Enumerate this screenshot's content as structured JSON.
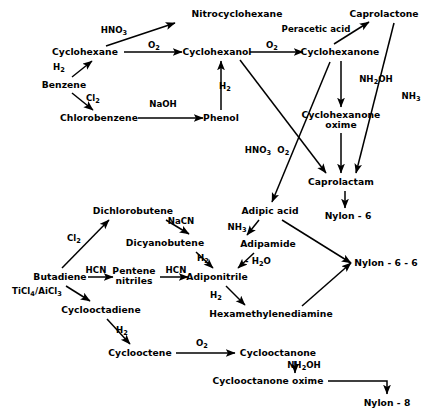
{
  "diagram": {
    "type": "reaction-scheme",
    "stroke_color": "#000000",
    "background_color": "#ffffff",
    "nodes": [
      {
        "id": "nitrocyclohexane",
        "label": "Nitrocyclohexane",
        "x": 237,
        "y": 14
      },
      {
        "id": "caprolactone",
        "label": "Caprolactone",
        "x": 384,
        "y": 14
      },
      {
        "id": "peracetic-acid",
        "label": "Peracetic acid",
        "x": 316,
        "y": 30
      },
      {
        "id": "cyclohexane",
        "label": "Cyclohexane",
        "x": 85,
        "y": 52
      },
      {
        "id": "cyclohexanol",
        "label": "Cyclohexanol",
        "x": 217,
        "y": 52
      },
      {
        "id": "cyclohexanone",
        "label": "Cyclohexanone",
        "x": 340,
        "y": 52
      },
      {
        "id": "benzene",
        "label": "Benzene",
        "x": 64,
        "y": 85
      },
      {
        "id": "chlorobenzene",
        "label": "Chlorobenzene",
        "x": 99,
        "y": 118
      },
      {
        "id": "phenol",
        "label": "Phenol",
        "x": 221,
        "y": 118
      },
      {
        "id": "cyclohexanone-oxime",
        "label": "Cyclohexanone\noxime",
        "x": 341,
        "y": 120
      },
      {
        "id": "caprolactam",
        "label": "Caprolactam",
        "x": 341,
        "y": 182
      },
      {
        "id": "adipic-acid",
        "label": "Adipic acid",
        "x": 270,
        "y": 211
      },
      {
        "id": "nylon-6",
        "label": "Nylon - 6",
        "x": 348,
        "y": 216
      },
      {
        "id": "dichlorobutene",
        "label": "Dichlorobutene",
        "x": 133,
        "y": 211
      },
      {
        "id": "dicyanobutene",
        "label": "Dicyanobutene",
        "x": 165,
        "y": 243
      },
      {
        "id": "adipamide",
        "label": "Adipamide",
        "x": 268,
        "y": 244
      },
      {
        "id": "butadiene",
        "label": "Butadiene",
        "x": 60,
        "y": 277
      },
      {
        "id": "pentene-nitriles",
        "label": "Pentene\nnitriles",
        "x": 134,
        "y": 276
      },
      {
        "id": "adiponitrile",
        "label": "Adiponitrile",
        "x": 217,
        "y": 277
      },
      {
        "id": "nylon-6-6",
        "label": "Nylon - 6 - 6",
        "x": 386,
        "y": 263
      },
      {
        "id": "cyclooctadiene",
        "label": "Cyclooctadiene",
        "x": 101,
        "y": 310
      },
      {
        "id": "hexamethylenediamine",
        "label": "Hexamethylenediamine",
        "x": 271,
        "y": 314
      },
      {
        "id": "cyclooctene",
        "label": "Cyclooctene",
        "x": 140,
        "y": 353
      },
      {
        "id": "cyclooctanone",
        "label": "Cyclooctanone",
        "x": 278,
        "y": 353
      },
      {
        "id": "cyclooctanone-oxime",
        "label": "Cyclooctanone oxime",
        "x": 268,
        "y": 381
      },
      {
        "id": "nylon-8",
        "label": "Nylon - 8",
        "x": 387,
        "y": 403
      }
    ],
    "reagents": [
      {
        "id": "hno3-a",
        "label": "HNO<sub>3</sub>",
        "x": 114,
        "y": 31
      },
      {
        "id": "o2-a",
        "label": "O<sub>2</sub>",
        "x": 154,
        "y": 46
      },
      {
        "id": "o2-b",
        "label": "O<sub>2</sub>",
        "x": 272,
        "y": 46
      },
      {
        "id": "h2-benzene",
        "label": "H<sub>2</sub>",
        "x": 59,
        "y": 68
      },
      {
        "id": "nh2oh-a",
        "label": "NH<sub>2</sub>OH",
        "x": 376,
        "y": 80
      },
      {
        "id": "nh3-caprolactone",
        "label": "NH<sub>3</sub>",
        "x": 411,
        "y": 97
      },
      {
        "id": "cl2-benzene",
        "label": "Cl<sub>2</sub>",
        "x": 93,
        "y": 99
      },
      {
        "id": "naoh",
        "label": "NaOH",
        "x": 163,
        "y": 105
      },
      {
        "id": "h2-phenol",
        "label": "H<sub>2</sub>",
        "x": 225,
        "y": 87
      },
      {
        "id": "hno3-o2",
        "label": "HNO<sub>3</sub>  O<sub>2</sub>",
        "x": 267,
        "y": 151
      },
      {
        "id": "cl2-butadiene",
        "label": "Cl<sub>2</sub>",
        "x": 74,
        "y": 239
      },
      {
        "id": "nacn",
        "label": "NaCN",
        "x": 181,
        "y": 222
      },
      {
        "id": "nh3-adipamide",
        "label": "NH<sub>3</sub>",
        "x": 237,
        "y": 228
      },
      {
        "id": "h2-dicyano",
        "label": "H<sub>2</sub>",
        "x": 203,
        "y": 259
      },
      {
        "id": "minus-h2o",
        "label": "- H<sub>2</sub>O",
        "x": 258,
        "y": 262
      },
      {
        "id": "hcn-1",
        "label": "HCN",
        "x": 96,
        "y": 271
      },
      {
        "id": "hcn-2",
        "label": "HCN",
        "x": 176,
        "y": 271
      },
      {
        "id": "ticl4",
        "label": "TiCl<sub>4</sub>/AiCl<sub>3</sub>",
        "x": 37,
        "y": 292
      },
      {
        "id": "h2-adiponitrile",
        "label": "H<sub>2</sub>",
        "x": 216,
        "y": 296
      },
      {
        "id": "h2-cyclooctadiene",
        "label": "H<sub>2</sub>",
        "x": 122,
        "y": 331
      },
      {
        "id": "o2-cyclooctene",
        "label": "O<sub>2</sub>",
        "x": 202,
        "y": 344
      },
      {
        "id": "nh2oh-b",
        "label": "NH<sub>2</sub>OH",
        "x": 304,
        "y": 366
      }
    ],
    "edges": [
      {
        "from": "benzene",
        "to": "cyclohexane",
        "reagent": "H<sub>2</sub>"
      },
      {
        "from": "benzene",
        "to": "chlorobenzene",
        "reagent": "Cl<sub>2</sub>"
      },
      {
        "from": "cyclohexane",
        "to": "nitrocyclohexane",
        "reagent": "HNO<sub>3</sub>"
      },
      {
        "from": "cyclohexane",
        "to": "cyclohexanol",
        "reagent": "O<sub>2</sub>"
      },
      {
        "from": "nitrocyclohexane",
        "to": "cyclohexanol",
        "reagent": ""
      },
      {
        "from": "chlorobenzene",
        "to": "phenol",
        "reagent": "NaOH"
      },
      {
        "from": "phenol",
        "to": "cyclohexanol",
        "reagent": "H<sub>2</sub>"
      },
      {
        "from": "cyclohexanol",
        "to": "cyclohexanone",
        "reagent": "O<sub>2</sub>"
      },
      {
        "from": "cyclohexanol",
        "to": "caprolactam",
        "reagent": ""
      },
      {
        "from": "cyclohexanone",
        "to": "caprolactone",
        "reagent": "Peracetic acid"
      },
      {
        "from": "cyclohexanone",
        "to": "cyclohexanone-oxime",
        "reagent": "NH<sub>2</sub>OH"
      },
      {
        "from": "cyclohexanone",
        "to": "adipic-acid",
        "reagent": "HNO<sub>3</sub>  O<sub>2</sub>"
      },
      {
        "from": "caprolactone",
        "to": "caprolactam",
        "reagent": "NH<sub>3</sub>"
      },
      {
        "from": "cyclohexanone-oxime",
        "to": "caprolactam",
        "reagent": ""
      },
      {
        "from": "caprolactam",
        "to": "nylon-6",
        "reagent": ""
      },
      {
        "from": "butadiene",
        "to": "dichlorobutene",
        "reagent": "Cl<sub>2</sub>"
      },
      {
        "from": "butadiene",
        "to": "pentene-nitriles",
        "reagent": "HCN"
      },
      {
        "from": "butadiene",
        "to": "cyclooctadiene",
        "reagent": "TiCl<sub>4</sub>/AiCl<sub>3</sub>"
      },
      {
        "from": "dichlorobutene",
        "to": "dicyanobutene",
        "reagent": "NaCN"
      },
      {
        "from": "dicyanobutene",
        "to": "adiponitrile",
        "reagent": "H<sub>2</sub>"
      },
      {
        "from": "pentene-nitriles",
        "to": "adiponitrile",
        "reagent": "HCN"
      },
      {
        "from": "adipic-acid",
        "to": "adipamide",
        "reagent": "NH<sub>3</sub>"
      },
      {
        "from": "adipamide",
        "to": "adiponitrile",
        "reagent": "- H<sub>2</sub>O"
      },
      {
        "from": "adipic-acid",
        "to": "nylon-6-6",
        "reagent": ""
      },
      {
        "from": "adiponitrile",
        "to": "hexamethylenediamine",
        "reagent": "H<sub>2</sub>"
      },
      {
        "from": "hexamethylenediamine",
        "to": "nylon-6-6",
        "reagent": ""
      },
      {
        "from": "cyclooctadiene",
        "to": "cyclooctene",
        "reagent": "H<sub>2</sub>"
      },
      {
        "from": "cyclooctene",
        "to": "cyclooctanone",
        "reagent": "O<sub>2</sub>"
      },
      {
        "from": "cyclooctanone",
        "to": "cyclooctanone-oxime",
        "reagent": "NH<sub>2</sub>OH"
      },
      {
        "from": "cyclooctanone-oxime",
        "to": "nylon-8",
        "reagent": ""
      }
    ]
  }
}
